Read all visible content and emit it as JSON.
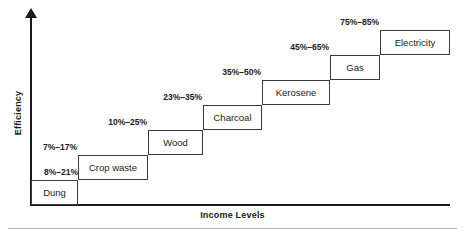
{
  "axes": {
    "y_label": "Efficiency",
    "x_label": "Income Levels"
  },
  "chart_data": {
    "type": "bar",
    "title": "",
    "subtitle": "",
    "xlabel": "Income Levels",
    "ylabel": "Efficiency",
    "grid": false,
    "legend": "none",
    "annotation": "Energy ladder: efficiency range of household fuels rising with income level",
    "categories": [
      "Dung",
      "Crop waste",
      "Wood",
      "Charcoal",
      "Kerosene",
      "Gas",
      "Electricity"
    ],
    "series": [
      {
        "name": "Efficiency low (%)",
        "values": [
          8,
          7,
          10,
          23,
          35,
          45,
          75
        ]
      },
      {
        "name": "Efficiency high (%)",
        "values": [
          21,
          17,
          25,
          35,
          50,
          65,
          85
        ]
      }
    ],
    "range_labels": [
      "8%–21%",
      "7%–17%",
      "10%–25%",
      "23%–35%",
      "35%–50%",
      "45%–65%",
      "75%–85%"
    ],
    "ylim": [
      0,
      100
    ],
    "steps": [
      {
        "name": "Dung",
        "range": "8%–21%",
        "low": 8,
        "high": 21,
        "box": {
          "left": 31,
          "top": 180,
          "width": 47,
          "height": 25
        },
        "label": {
          "left": 0,
          "top": 168,
          "width": 78
        }
      },
      {
        "name": "Crop waste",
        "range": "7%–17%",
        "low": 7,
        "high": 17,
        "box": {
          "left": 78,
          "top": 155,
          "width": 70,
          "height": 25
        },
        "label": {
          "left": 22,
          "top": 143,
          "width": 55
        }
      },
      {
        "name": "Wood",
        "range": "10%–25%",
        "low": 10,
        "high": 25,
        "box": {
          "left": 148,
          "top": 130,
          "width": 55,
          "height": 25
        },
        "label": {
          "left": 86,
          "top": 118,
          "width": 61
        }
      },
      {
        "name": "Charcoal",
        "range": "23%–35%",
        "low": 23,
        "high": 35,
        "box": {
          "left": 203,
          "top": 105,
          "width": 59,
          "height": 25
        },
        "label": {
          "left": 141,
          "top": 93,
          "width": 61
        }
      },
      {
        "name": "Kerosene",
        "range": "35%–50%",
        "low": 35,
        "high": 50,
        "box": {
          "left": 262,
          "top": 80,
          "width": 68,
          "height": 25
        },
        "label": {
          "left": 200,
          "top": 68,
          "width": 61
        }
      },
      {
        "name": "Gas",
        "range": "45%–65%",
        "low": 45,
        "high": 65,
        "box": {
          "left": 330,
          "top": 55,
          "width": 50,
          "height": 25
        },
        "label": {
          "left": 268,
          "top": 43,
          "width": 61
        }
      },
      {
        "name": "Electricity",
        "range": "75%–85%",
        "low": 75,
        "high": 85,
        "box": {
          "left": 380,
          "top": 30,
          "width": 70,
          "height": 25
        },
        "label": {
          "left": 318,
          "top": 18,
          "width": 61
        }
      }
    ]
  },
  "colors": {
    "line": "#3a3a3a",
    "axis": "#1a1a1a",
    "text": "#1a1a1a",
    "rule": "#b8b8b8",
    "background": "#ffffff"
  }
}
